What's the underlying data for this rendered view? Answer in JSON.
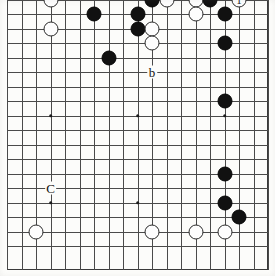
{
  "figure": {
    "kind": "go-board-diagram",
    "board_size": 19,
    "colors": {
      "black_stone": "#111111",
      "white_stone": "#fdfdfd",
      "stone_outline": "#2b2b2b",
      "grid_line": "#4a4a4a",
      "border": "#3a3a3a",
      "background": "#fcfcfa"
    },
    "geometry": {
      "origin_x": 7,
      "origin_y": -15,
      "spacing": 14.5,
      "stone_diameter": 15,
      "border_left": 7,
      "border_top": 0,
      "border_width": 261,
      "border_height": 270,
      "visible_cols": [
        1,
        18
      ],
      "visible_rows": [
        1,
        19
      ]
    },
    "star_points": [
      {
        "col": 4,
        "row": 4
      },
      {
        "col": 10,
        "row": 4
      },
      {
        "col": 4,
        "row": 10
      },
      {
        "col": 10,
        "row": 10
      },
      {
        "col": 4,
        "row": 16
      },
      {
        "col": 10,
        "row": 16
      },
      {
        "col": 16,
        "row": 10
      }
    ],
    "stones": [
      {
        "color": "white",
        "col": 4,
        "row": 2,
        "label": ""
      },
      {
        "color": "white",
        "col": 4,
        "row": 4,
        "label": ""
      },
      {
        "color": "black",
        "col": 7,
        "row": 3,
        "label": ""
      },
      {
        "color": "black",
        "col": 11,
        "row": 2,
        "label": ""
      },
      {
        "color": "white",
        "col": 12,
        "row": 2,
        "label": ""
      },
      {
        "color": "black",
        "col": 10,
        "row": 3,
        "label": ""
      },
      {
        "color": "black",
        "col": 10,
        "row": 4,
        "label": ""
      },
      {
        "color": "white",
        "col": 11,
        "row": 4,
        "label": ""
      },
      {
        "color": "white",
        "col": 11,
        "row": 5,
        "label": ""
      },
      {
        "color": "black",
        "col": 8,
        "row": 6,
        "label": ""
      },
      {
        "color": "white",
        "col": 14,
        "row": 2,
        "label": ""
      },
      {
        "color": "black",
        "col": 15,
        "row": 2,
        "label": ""
      },
      {
        "color": "white",
        "col": 14,
        "row": 3,
        "label": ""
      },
      {
        "color": "black",
        "col": 16,
        "row": 3,
        "label": ""
      },
      {
        "color": "white",
        "col": 17,
        "row": 2,
        "label": "1"
      },
      {
        "color": "black",
        "col": 16,
        "row": 5,
        "label": ""
      },
      {
        "color": "black",
        "col": 16,
        "row": 9,
        "label": ""
      },
      {
        "color": "black",
        "col": 16,
        "row": 14,
        "label": ""
      },
      {
        "color": "black",
        "col": 16,
        "row": 16,
        "label": ""
      },
      {
        "color": "black",
        "col": 17,
        "row": 17,
        "label": ""
      },
      {
        "color": "white",
        "col": 3,
        "row": 18,
        "label": ""
      },
      {
        "color": "white",
        "col": 11,
        "row": 18,
        "label": ""
      },
      {
        "color": "white",
        "col": 14,
        "row": 18,
        "label": ""
      },
      {
        "color": "white",
        "col": 16,
        "row": 18,
        "label": ""
      }
    ],
    "markers": [
      {
        "text": "a",
        "col": 15,
        "row": 1
      },
      {
        "text": "b",
        "col": 11,
        "row": 7
      },
      {
        "text": "C",
        "col": 4,
        "row": 15
      }
    ]
  }
}
